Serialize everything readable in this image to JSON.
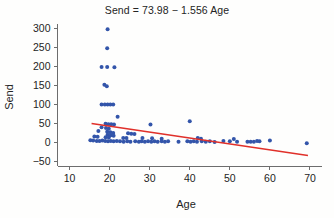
{
  "chart_data": {
    "type": "scatter",
    "title": "Send = 73.98 − 1.556 Age",
    "xlabel": "Age",
    "ylabel": "Send",
    "xlim": [
      7,
      73
    ],
    "ylim": [
      -62,
      312
    ],
    "xticks": [
      10,
      20,
      30,
      40,
      50,
      60,
      70
    ],
    "yticks": [
      -50,
      0,
      50,
      100,
      150,
      200,
      250,
      300
    ],
    "grid": false,
    "legend": "none",
    "marker_color": "#3355aa",
    "line_color": "#e0302a",
    "regression": {
      "equation": "Send = 73.98 − 1.556 Age",
      "intercept": 73.98,
      "slope": -1.556,
      "x_start": 15.5,
      "x_end": 69.5
    },
    "points": [
      {
        "x": 19.5,
        "y": 298
      },
      {
        "x": 19.4,
        "y": 248
      },
      {
        "x": 18.0,
        "y": 199
      },
      {
        "x": 19.4,
        "y": 199
      },
      {
        "x": 21.2,
        "y": 198
      },
      {
        "x": 18.7,
        "y": 152
      },
      {
        "x": 19.3,
        "y": 148
      },
      {
        "x": 18.0,
        "y": 100
      },
      {
        "x": 18.8,
        "y": 100
      },
      {
        "x": 19.5,
        "y": 100
      },
      {
        "x": 20.2,
        "y": 100
      },
      {
        "x": 20.9,
        "y": 100
      },
      {
        "x": 22.0,
        "y": 68
      },
      {
        "x": 40.0,
        "y": 56
      },
      {
        "x": 19.0,
        "y": 49
      },
      {
        "x": 19.7,
        "y": 48
      },
      {
        "x": 20.4,
        "y": 48
      },
      {
        "x": 21.1,
        "y": 47
      },
      {
        "x": 30.2,
        "y": 47
      },
      {
        "x": 18.0,
        "y": 40
      },
      {
        "x": 19.1,
        "y": 38
      },
      {
        "x": 19.8,
        "y": 36
      },
      {
        "x": 17.2,
        "y": 30
      },
      {
        "x": 19.4,
        "y": 28
      },
      {
        "x": 20.2,
        "y": 27
      },
      {
        "x": 20.9,
        "y": 25
      },
      {
        "x": 24.6,
        "y": 24
      },
      {
        "x": 25.4,
        "y": 23
      },
      {
        "x": 26.2,
        "y": 22
      },
      {
        "x": 19.5,
        "y": 20
      },
      {
        "x": 20.3,
        "y": 19
      },
      {
        "x": 21.0,
        "y": 18
      },
      {
        "x": 16.2,
        "y": 16
      },
      {
        "x": 17.0,
        "y": 15
      },
      {
        "x": 19.0,
        "y": 14
      },
      {
        "x": 19.8,
        "y": 13
      },
      {
        "x": 23.4,
        "y": 12
      },
      {
        "x": 24.2,
        "y": 12
      },
      {
        "x": 28.2,
        "y": 12
      },
      {
        "x": 30.6,
        "y": 11
      },
      {
        "x": 33.0,
        "y": 10
      },
      {
        "x": 42.0,
        "y": 12
      },
      {
        "x": 42.8,
        "y": 10
      },
      {
        "x": 15.2,
        "y": 6
      },
      {
        "x": 15.9,
        "y": 5
      },
      {
        "x": 16.8,
        "y": 4
      },
      {
        "x": 17.5,
        "y": 4
      },
      {
        "x": 18.2,
        "y": 5
      },
      {
        "x": 18.9,
        "y": 4
      },
      {
        "x": 19.6,
        "y": 3
      },
      {
        "x": 20.3,
        "y": 4
      },
      {
        "x": 21.0,
        "y": 3
      },
      {
        "x": 21.8,
        "y": 4
      },
      {
        "x": 22.6,
        "y": 3
      },
      {
        "x": 23.5,
        "y": 2
      },
      {
        "x": 24.4,
        "y": 3
      },
      {
        "x": 25.2,
        "y": 2
      },
      {
        "x": 26.4,
        "y": 3
      },
      {
        "x": 27.3,
        "y": 2
      },
      {
        "x": 28.0,
        "y": 3
      },
      {
        "x": 28.8,
        "y": 2
      },
      {
        "x": 29.6,
        "y": 3
      },
      {
        "x": 30.4,
        "y": 2
      },
      {
        "x": 31.2,
        "y": 3
      },
      {
        "x": 32.0,
        "y": 2
      },
      {
        "x": 33.0,
        "y": 3
      },
      {
        "x": 33.8,
        "y": 2
      },
      {
        "x": 34.6,
        "y": 3
      },
      {
        "x": 37.2,
        "y": 2
      },
      {
        "x": 39.4,
        "y": 3
      },
      {
        "x": 40.2,
        "y": 2
      },
      {
        "x": 41.0,
        "y": 3
      },
      {
        "x": 41.8,
        "y": 2
      },
      {
        "x": 43.0,
        "y": 3
      },
      {
        "x": 44.0,
        "y": 2
      },
      {
        "x": 45.0,
        "y": 3
      },
      {
        "x": 46.2,
        "y": 1
      },
      {
        "x": 48.4,
        "y": 4
      },
      {
        "x": 50.0,
        "y": 3
      },
      {
        "x": 51.0,
        "y": 9
      },
      {
        "x": 51.8,
        "y": 2
      },
      {
        "x": 54.4,
        "y": 2
      },
      {
        "x": 55.2,
        "y": 2
      },
      {
        "x": 56.0,
        "y": 2
      },
      {
        "x": 56.8,
        "y": 4
      },
      {
        "x": 57.4,
        "y": 3
      },
      {
        "x": 60.0,
        "y": 5
      },
      {
        "x": 69.2,
        "y": -2
      }
    ]
  }
}
